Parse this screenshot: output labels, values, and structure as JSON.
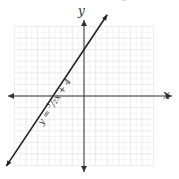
{
  "chart_data": {
    "type": "line",
    "title": "",
    "xlabel": "x",
    "ylabel": "y",
    "xlim": [
      -6,
      6
    ],
    "ylim": [
      -6,
      6
    ],
    "grid": true,
    "series": [
      {
        "name": "y = (3/2)x + 4",
        "slope": 1.5,
        "intercept": 4,
        "x": [
          -6.7,
          2.0
        ],
        "y": [
          -6.05,
          7.0
        ]
      }
    ],
    "annotations": [
      {
        "text": "y = 3/2 x + 4",
        "position": "along line, below x-axis"
      }
    ]
  },
  "labels": {
    "x_axis": "x",
    "y_axis": "y",
    "equation_prefix": "y = ",
    "num": "3",
    "den": "2",
    "equation_suffix": "x + 4",
    "corner_mark": "2"
  }
}
